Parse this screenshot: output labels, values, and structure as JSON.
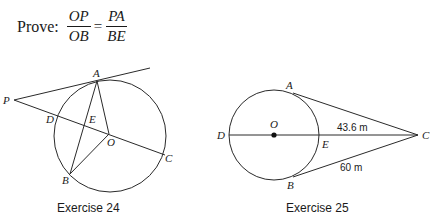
{
  "prove": {
    "label": "Prove:",
    "lhs": {
      "numerator": "OP",
      "denominator": "OB"
    },
    "equals": "=",
    "rhs": {
      "numerator": "PA",
      "denominator": "BE"
    }
  },
  "exercise24": {
    "caption": "Exercise 24",
    "points": {
      "P": "P",
      "A": "A",
      "D": "D",
      "E": "E",
      "O": "O",
      "C": "C",
      "B": "B"
    }
  },
  "exercise25": {
    "caption": "Exercise 25",
    "points": {
      "A": "A",
      "D": "D",
      "O": "O",
      "E": "E",
      "C": "C",
      "B": "B"
    },
    "measures": {
      "EC": "43.6 m",
      "BC": "60 m"
    }
  }
}
